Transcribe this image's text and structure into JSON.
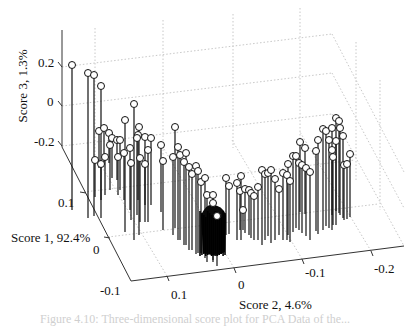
{
  "chart_data": {
    "type": "scatter3d-stem",
    "title": "",
    "axes": {
      "x": {
        "label": "Score 1, 92.4%",
        "ticks": [
          "-0.1",
          "0",
          "0.1"
        ]
      },
      "y": {
        "label": "Score 2, 4.6%",
        "ticks": [
          "0.1",
          "0",
          "-0.1",
          "-0.2"
        ]
      },
      "z": {
        "label": "Score 3, 1.3%",
        "ticks": [
          "0.2",
          "0",
          "-0.2"
        ]
      }
    },
    "grid": true,
    "marker": "circle",
    "stem_base": "floor",
    "points_screen": [
      [
        72,
        65,
        210
      ],
      [
        88,
        73,
        218
      ],
      [
        94,
        75,
        216
      ],
      [
        101,
        86,
        218
      ],
      [
        134,
        104,
        240
      ],
      [
        125,
        120,
        232
      ],
      [
        139,
        127,
        235
      ],
      [
        99,
        131,
        168
      ],
      [
        104,
        128,
        165
      ],
      [
        109,
        133,
        163
      ],
      [
        112,
        138,
        178
      ],
      [
        117,
        140,
        180
      ],
      [
        120,
        140,
        190
      ],
      [
        138,
        135,
        200
      ],
      [
        145,
        137,
        205
      ],
      [
        151,
        138,
        205
      ],
      [
        161,
        145,
        212
      ],
      [
        163,
        161,
        230
      ],
      [
        131,
        163,
        220
      ],
      [
        175,
        127,
        228
      ],
      [
        173,
        157,
        235
      ],
      [
        178,
        147,
        240
      ],
      [
        180,
        155,
        240
      ],
      [
        186,
        153,
        245
      ],
      [
        184,
        162,
        245
      ],
      [
        189,
        167,
        250
      ],
      [
        192,
        174,
        250
      ],
      [
        196,
        166,
        254
      ],
      [
        198,
        171,
        253
      ],
      [
        201,
        182,
        253
      ],
      [
        205,
        178,
        258
      ],
      [
        207,
        195,
        262
      ],
      [
        213,
        195,
        260
      ],
      [
        213,
        203,
        262
      ],
      [
        217,
        216,
        266
      ],
      [
        95,
        160,
        197
      ],
      [
        101,
        164,
        200
      ],
      [
        105,
        157,
        195
      ],
      [
        110,
        145,
        190
      ],
      [
        118,
        157,
        195
      ],
      [
        124,
        153,
        200
      ],
      [
        130,
        148,
        210
      ],
      [
        137,
        138,
        215
      ],
      [
        140,
        158,
        222
      ],
      [
        145,
        164,
        222
      ],
      [
        148,
        150,
        222
      ],
      [
        226,
        178,
        235
      ],
      [
        229,
        186,
        234
      ],
      [
        237,
        183,
        240
      ],
      [
        241,
        176,
        240
      ],
      [
        240,
        191,
        230
      ],
      [
        243,
        210,
        230
      ],
      [
        245,
        189,
        233
      ],
      [
        249,
        190,
        235
      ],
      [
        251,
        193,
        238
      ],
      [
        254,
        196,
        240
      ],
      [
        258,
        187,
        240
      ],
      [
        262,
        170,
        245
      ],
      [
        265,
        174,
        240
      ],
      [
        268,
        173,
        236
      ],
      [
        271,
        170,
        243
      ],
      [
        275,
        179,
        240
      ],
      [
        279,
        189,
        235
      ],
      [
        283,
        173,
        240
      ],
      [
        287,
        175,
        240
      ],
      [
        290,
        181,
        242
      ],
      [
        288,
        164,
        235
      ],
      [
        293,
        156,
        232
      ],
      [
        296,
        156,
        228
      ],
      [
        299,
        163,
        230
      ],
      [
        302,
        165,
        233
      ],
      [
        306,
        168,
        236
      ],
      [
        310,
        172,
        240
      ],
      [
        316,
        151,
        231
      ],
      [
        318,
        140,
        234
      ],
      [
        323,
        129,
        230
      ],
      [
        326,
        131,
        226
      ],
      [
        329,
        140,
        228
      ],
      [
        332,
        150,
        230
      ],
      [
        333,
        157,
        225
      ],
      [
        336,
        141,
        225
      ],
      [
        332,
        128,
        215
      ],
      [
        336,
        118,
        211
      ],
      [
        339,
        121,
        213
      ],
      [
        340,
        128,
        215
      ],
      [
        343,
        136,
        218
      ],
      [
        344,
        165,
        220
      ],
      [
        347,
        164,
        219
      ],
      [
        350,
        154,
        217
      ],
      [
        300,
        142,
        212
      ],
      [
        305,
        148,
        214
      ]
    ],
    "cluster": {
      "x_range": [
        199,
        226
      ],
      "y_range": [
        203,
        256
      ],
      "center": [
        212,
        230
      ]
    }
  },
  "caption_partial": "Figure 4.10: Three-dimensional score plot for PCA Data of the..."
}
